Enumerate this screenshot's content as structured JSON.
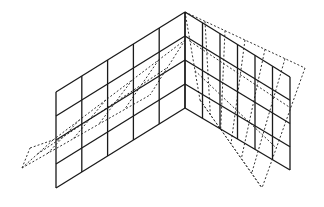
{
  "diagram": {
    "colors": {
      "undeformed": "#1a1a1a",
      "deformed": "#333333",
      "background": "#ffffff"
    },
    "left_wall": {
      "columns": 5,
      "rows": 4,
      "corners": {
        "top_left": [
          56,
          92
        ],
        "bottom_left": [
          56,
          188
        ],
        "top_right": [
          185,
          12
        ],
        "bottom_right": [
          185,
          108
        ]
      }
    },
    "right_wall": {
      "columns": 6,
      "rows": 4,
      "corners": {
        "top_left": [
          185,
          12
        ],
        "bottom_left": [
          185,
          108
        ],
        "top_right": [
          290,
          77
        ],
        "bottom_right": [
          290,
          170
        ]
      }
    },
    "deformed_outline": {
      "left_tip": [
        [
          22,
          168
        ],
        [
          30,
          148
        ],
        [
          53,
          140
        ]
      ],
      "right_tip": [
        [
          185,
          12
        ],
        [
          305,
          68
        ],
        [
          262,
          188
        ]
      ]
    }
  }
}
